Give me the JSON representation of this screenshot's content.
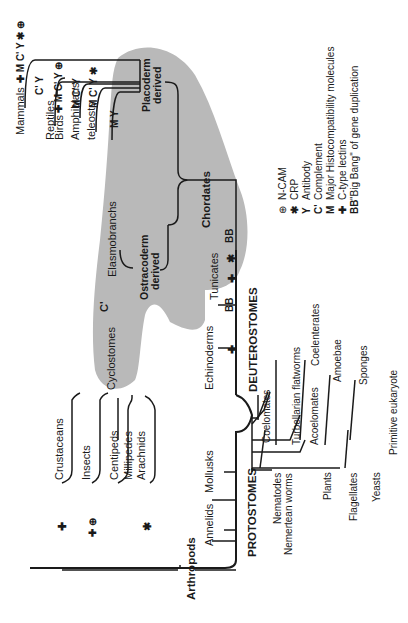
{
  "diagram": {
    "orientation": "rotated 90deg counter-clockwise",
    "groups": {
      "protostomes": "PROTOSTOMES",
      "deuterostomes": "DEUTEROSTOMES",
      "chordates": "Chordates",
      "arthropods": "Arthropods",
      "coelomates": "Coelomates",
      "acoelomates": "Acoelomates",
      "primitive_eukaryote": "Primitive eukaryote",
      "placoderm": [
        "Placoderm",
        "derived"
      ],
      "ostracoderm": [
        "Ostracoderm",
        "derived"
      ]
    },
    "vertebrates": [
      {
        "name": "Mammals",
        "markers": "✚ M C' Y ✱ ⊕"
      },
      {
        "name": "Reptiles",
        "markers": "C' Y"
      },
      {
        "name": "Birds",
        "markers": "✚ M C' Y ⊕"
      },
      {
        "name": "Amphibians",
        "markers": "M C' Y"
      },
      {
        "name": "teleosts",
        "markers": "M C' Y ✱"
      },
      {
        "name": "Elasmobranchs",
        "markers": "M Y"
      }
    ],
    "deuterostome_taxa": {
      "cyclostomes": "Cyclostomes",
      "cyclostomes_marker": "C'",
      "tunicates": "Tunicates",
      "echinoderms": "Echinoderms",
      "bb": "BB",
      "plus": "✚",
      "star": "✱"
    },
    "arthropod_taxa": [
      {
        "name": "Crustaceans",
        "marker": "✚"
      },
      {
        "name": "Insects",
        "marker": "✚ ⊕"
      },
      {
        "name": "Centipeds",
        "marker": ""
      },
      {
        "name": "Millipedes",
        "marker": ""
      },
      {
        "name": "Arachnids",
        "marker": "✱"
      }
    ],
    "protostome_taxa": [
      "Annelids",
      "Mollusks"
    ],
    "lower_taxa": {
      "nematodes": "Nematodes",
      "nemertean": "Nemertean worms",
      "turbellarian": "Turbellarian flatworms",
      "coelenterates": "Coelenterates",
      "plants": "Plants",
      "amoebae": "Amoebae",
      "flagellates": "Flagellates",
      "sponges": "Sponges",
      "yeasts": "Yeasts"
    }
  },
  "legend": [
    {
      "symbol": "⊕",
      "label": "N-CAM"
    },
    {
      "symbol": "✱",
      "label": "CRP"
    },
    {
      "symbol": "Y",
      "label": "Antibody"
    },
    {
      "symbol": "C'",
      "label": "Complement"
    },
    {
      "symbol": "M",
      "label": "Major Histocompatibility molecules"
    },
    {
      "symbol": "✚",
      "label": "C-type lectins"
    },
    {
      "symbol": "BB",
      "label": "\"Big Bang\" of gene duplication"
    }
  ],
  "colors": {
    "shade": "#b5b5b5",
    "ink": "#1a1a1a",
    "paper": "#ffffff"
  }
}
